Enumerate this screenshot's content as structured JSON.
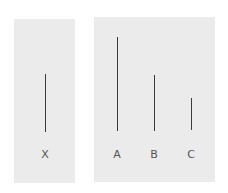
{
  "diagram": {
    "title": "",
    "colors": {
      "panel": "#ebebeb",
      "line": "#3a3a3a",
      "label": "#555555"
    },
    "standard_card": {
      "lines": [
        {
          "label": "X",
          "x": 45,
          "y1": 74,
          "y2": 132
        }
      ]
    },
    "comparison_card": {
      "lines": [
        {
          "label": "A",
          "x": 117,
          "y1": 37,
          "y2": 131
        },
        {
          "label": "B",
          "x": 154,
          "y1": 75,
          "y2": 131
        },
        {
          "label": "C",
          "x": 191,
          "y1": 98,
          "y2": 130
        }
      ]
    }
  }
}
